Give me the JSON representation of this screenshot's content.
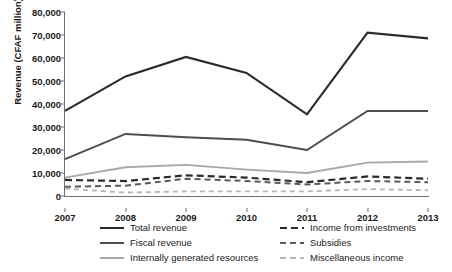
{
  "chart_data": {
    "type": "line",
    "title": "",
    "xlabel": "",
    "ylabel": "Revenue (CFAF million)",
    "categories": [
      "2007",
      "2008",
      "2009",
      "2010",
      "2011",
      "2012",
      "2013"
    ],
    "x": [
      2007,
      2008,
      2009,
      2010,
      2011,
      2012,
      2013
    ],
    "ylim": [
      0,
      80000
    ],
    "yticks": [
      0,
      10000,
      20000,
      30000,
      40000,
      50000,
      60000,
      70000,
      80000
    ],
    "ytick_labels": [
      "0",
      "10,000",
      "20,000",
      "30,000",
      "40,000",
      "50,000",
      "60,000",
      "70,000",
      "80,000"
    ],
    "grid": false,
    "legend_position": "bottom",
    "series": [
      {
        "name": "Total revenue",
        "values": [
          37000,
          52000,
          60500,
          53500,
          35500,
          71000,
          68500
        ],
        "color": "#2b2b2b",
        "style": "solid",
        "width": 2.2
      },
      {
        "name": "Fiscal revenue",
        "values": [
          16000,
          27000,
          25500,
          24500,
          20000,
          37000,
          37000
        ],
        "color": "#4d4d4d",
        "style": "solid",
        "width": 2.0
      },
      {
        "name": "Internally generated resources",
        "values": [
          8000,
          12500,
          13500,
          11500,
          10000,
          14500,
          15000
        ],
        "color": "#a8a8a8",
        "style": "solid",
        "width": 1.8
      },
      {
        "name": "Income from investments",
        "values": [
          7000,
          6500,
          9000,
          8000,
          6000,
          8500,
          7500
        ],
        "color": "#2b2b2b",
        "style": "dashed",
        "width": 2.2
      },
      {
        "name": "Subsidies",
        "values": [
          4000,
          4500,
          7500,
          6500,
          5000,
          6500,
          6000
        ],
        "color": "#5a5a5a",
        "style": "dashed",
        "width": 2.0
      },
      {
        "name": "Miscellaneous income",
        "values": [
          3200,
          1500,
          2000,
          2000,
          2000,
          3000,
          2500
        ],
        "color": "#b5b5b5",
        "style": "dashed",
        "width": 1.8
      }
    ]
  },
  "legend": {
    "items": [
      {
        "label": "Total revenue"
      },
      {
        "label": "Fiscal revenue"
      },
      {
        "label": "Internally generated resources"
      },
      {
        "label": "Income from investments"
      },
      {
        "label": "Subsidies"
      },
      {
        "label": "Miscellaneous income"
      }
    ]
  },
  "colors": {
    "axis": "#6e6e6e",
    "text": "#1a1a1a",
    "background": "#ffffff"
  }
}
